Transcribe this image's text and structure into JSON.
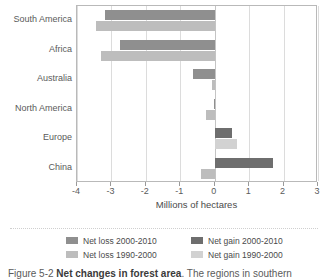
{
  "chart_data": {
    "type": "bar",
    "orientation": "horizontal",
    "title": "",
    "xlabel": "Millions of hectares",
    "ylabel": "",
    "xlim": [
      -4,
      3
    ],
    "xticks": [
      -4,
      -3,
      -2,
      -1,
      0,
      1,
      2,
      3
    ],
    "xtick_labels": [
      "-4",
      "-3",
      "-2",
      "-1",
      "0",
      "1",
      "2",
      "3"
    ],
    "grid": true,
    "legend_position": "bottom",
    "categories": [
      "South America",
      "Africa",
      "Australia",
      "North America",
      "Europe",
      "China"
    ],
    "series": [
      {
        "name": "Net loss 2000-2010",
        "color": "#8f8f8f",
        "values": [
          -3.2,
          -2.75,
          -0.62,
          -0.02,
          0,
          0
        ]
      },
      {
        "name": "Net loss 1990-2000",
        "color": "#bdbdbd",
        "values": [
          -3.45,
          -3.3,
          -0.08,
          -0.25,
          0,
          -0.4
        ]
      },
      {
        "name": "Net gain 2000-2010",
        "color": "#6e6e6e",
        "values": [
          0,
          0,
          0,
          0,
          0.5,
          1.7
        ]
      },
      {
        "name": "Net gain 1990-2000",
        "color": "#d2d2d2",
        "values": [
          0,
          0,
          0,
          0,
          0.65,
          0
        ]
      }
    ],
    "bars": [
      {
        "category": "South America",
        "row": "a",
        "series": "Net loss 2000-2010",
        "value": -3.2,
        "color": "#8f8f8f"
      },
      {
        "category": "South America",
        "row": "b",
        "series": "Net loss 1990-2000",
        "value": -3.45,
        "color": "#bdbdbd"
      },
      {
        "category": "Africa",
        "row": "a",
        "series": "Net loss 2000-2010",
        "value": -2.75,
        "color": "#8f8f8f"
      },
      {
        "category": "Africa",
        "row": "b",
        "series": "Net loss 1990-2000",
        "value": -3.3,
        "color": "#bdbdbd"
      },
      {
        "category": "Australia",
        "row": "a",
        "series": "Net loss 2000-2010",
        "value": -0.62,
        "color": "#8f8f8f"
      },
      {
        "category": "Australia",
        "row": "b",
        "series": "Net loss 1990-2000",
        "value": -0.08,
        "color": "#bdbdbd"
      },
      {
        "category": "North America",
        "row": "a",
        "series": "Net loss 2000-2010",
        "value": -0.02,
        "color": "#8f8f8f"
      },
      {
        "category": "North America",
        "row": "b",
        "series": "Net loss 1990-2000",
        "value": -0.25,
        "color": "#bdbdbd"
      },
      {
        "category": "Europe",
        "row": "a",
        "series": "Net gain 2000-2010",
        "value": 0.5,
        "color": "#6e6e6e"
      },
      {
        "category": "Europe",
        "row": "b",
        "series": "Net gain 1990-2000",
        "value": 0.65,
        "color": "#d2d2d2"
      },
      {
        "category": "China",
        "row": "a",
        "series": "Net gain 2000-2010",
        "value": 1.7,
        "color": "#6e6e6e"
      },
      {
        "category": "China",
        "row": "b",
        "series": "Net loss 1990-2000",
        "value": -0.4,
        "color": "#bdbdbd"
      }
    ]
  },
  "legend": {
    "left_column": [
      {
        "label": "Net loss 2000-2010",
        "color": "#8f8f8f"
      },
      {
        "label": "Net loss 1990-2000",
        "color": "#bdbdbd"
      }
    ],
    "right_column": [
      {
        "label": "Net gain 2000-2010",
        "color": "#6e6e6e"
      },
      {
        "label": "Net gain 1990-2000",
        "color": "#d2d2d2"
      }
    ]
  },
  "caption": {
    "prefix": "Figure 5-2",
    "strong": "Net changes in forest area",
    "rest": ". The regions in southern"
  }
}
